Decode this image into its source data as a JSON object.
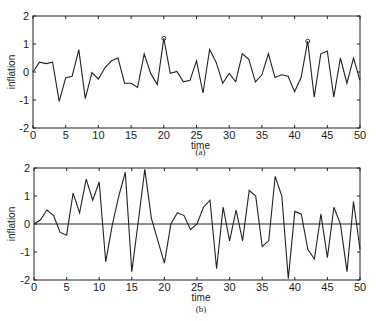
{
  "chart_data": [
    {
      "type": "line",
      "caption": "(a)",
      "title": "",
      "xlabel": "time",
      "ylabel": "inflation",
      "xlim": [
        0,
        50
      ],
      "ylim": [
        -2,
        2
      ],
      "xticks": [
        0,
        5,
        10,
        15,
        20,
        25,
        30,
        35,
        40,
        45,
        50
      ],
      "yticks": [
        -2,
        -1,
        0,
        1,
        2
      ],
      "grid": false,
      "zero_line": false,
      "x": [
        0,
        1,
        2,
        3,
        4,
        5,
        6,
        7,
        8,
        9,
        10,
        11,
        12,
        13,
        14,
        15,
        16,
        17,
        18,
        19,
        20,
        21,
        22,
        23,
        24,
        25,
        26,
        27,
        28,
        29,
        30,
        31,
        32,
        33,
        34,
        35,
        36,
        37,
        38,
        39,
        40,
        41,
        42,
        43,
        44,
        45,
        46,
        47,
        48,
        49,
        50
      ],
      "values": [
        0.0,
        0.35,
        0.3,
        0.35,
        -1.05,
        -0.2,
        -0.15,
        0.8,
        -0.95,
        -0.02,
        -0.25,
        0.15,
        0.4,
        0.5,
        -0.4,
        -0.4,
        -0.55,
        0.65,
        -0.05,
        -0.45,
        1.2,
        -0.05,
        0.02,
        -0.35,
        -0.3,
        0.4,
        -0.75,
        0.8,
        0.35,
        -0.4,
        -0.05,
        -0.35,
        0.65,
        0.45,
        -0.35,
        -0.1,
        0.65,
        -0.2,
        -0.1,
        -0.15,
        -0.7,
        -0.2,
        1.1,
        -0.9,
        0.65,
        0.75,
        -0.9,
        0.5,
        -0.4,
        0.5,
        -0.3
      ],
      "markers": [
        {
          "x": 20,
          "y": 1.2,
          "shape": "circle"
        },
        {
          "x": 42,
          "y": 1.1,
          "shape": "circle"
        }
      ]
    },
    {
      "type": "line",
      "caption": "(b)",
      "title": "",
      "xlabel": "time",
      "ylabel": "inflation",
      "xlim": [
        0,
        50
      ],
      "ylim": [
        -2,
        2
      ],
      "xticks": [
        0,
        5,
        10,
        15,
        20,
        25,
        30,
        35,
        40,
        45,
        50
      ],
      "yticks": [
        -2,
        -1,
        0,
        1,
        2
      ],
      "grid": false,
      "zero_line": true,
      "x": [
        0,
        1,
        2,
        3,
        4,
        5,
        6,
        7,
        8,
        9,
        10,
        11,
        12,
        13,
        14,
        15,
        16,
        17,
        18,
        19,
        20,
        21,
        22,
        23,
        24,
        25,
        26,
        27,
        28,
        29,
        30,
        31,
        32,
        33,
        34,
        35,
        36,
        37,
        38,
        39,
        40,
        41,
        42,
        43,
        44,
        45,
        46,
        47,
        48,
        49,
        50
      ],
      "values": [
        0.0,
        0.15,
        0.5,
        0.3,
        -0.3,
        -0.4,
        1.1,
        0.4,
        1.6,
        0.85,
        1.5,
        -1.35,
        -0.05,
        1.0,
        1.85,
        -1.7,
        0.1,
        1.95,
        0.2,
        -0.6,
        -1.4,
        0.0,
        0.4,
        0.3,
        -0.2,
        0.0,
        0.6,
        0.85,
        -1.6,
        0.6,
        -0.6,
        0.5,
        -0.6,
        1.2,
        1.0,
        -0.8,
        -0.6,
        1.7,
        1.0,
        -1.95,
        0.45,
        0.35,
        -0.9,
        -1.25,
        0.35,
        -1.2,
        0.6,
        0.0,
        -1.7,
        0.8,
        -0.9
      ],
      "markers": []
    }
  ]
}
